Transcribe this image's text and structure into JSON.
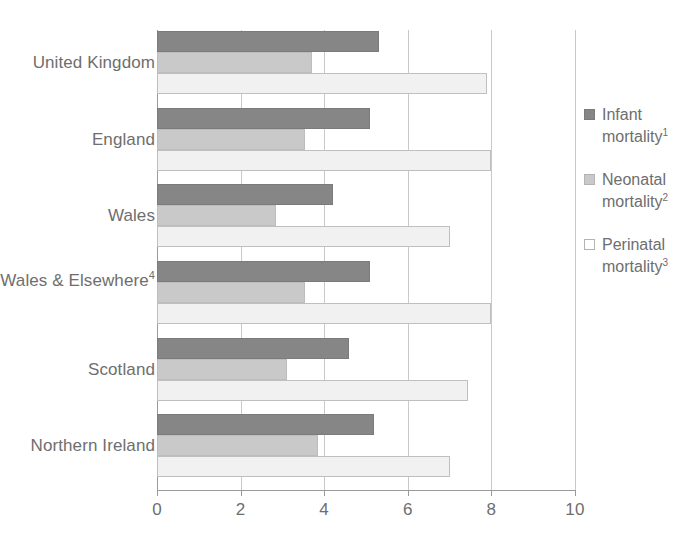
{
  "chart_data": {
    "type": "bar",
    "orientation": "horizontal",
    "title": "",
    "xlabel": "",
    "ylabel": "",
    "xlim": [
      0,
      10
    ],
    "xticks": [
      0,
      2,
      4,
      6,
      8,
      10
    ],
    "xtick_labels": [
      "0",
      "2",
      "4",
      "6",
      "8",
      "10"
    ],
    "grid": true,
    "legend_position": "right",
    "categories": [
      "United Kingdom",
      "England",
      "Wales",
      "England, Wales & Elsewhere",
      "Scotland",
      "Northern Ireland"
    ],
    "category_footnotes": [
      "",
      "",
      "",
      "4",
      "",
      ""
    ],
    "series": [
      {
        "name": "Infant mortality",
        "footnote": "1",
        "color": "#868686",
        "values": [
          5.3,
          5.1,
          4.2,
          5.1,
          4.6,
          5.2
        ]
      },
      {
        "name": "Neonatal mortality",
        "footnote": "2",
        "color": "#c9c9c9",
        "values": [
          3.7,
          3.55,
          2.85,
          3.55,
          3.1,
          3.85
        ]
      },
      {
        "name": "Perinatal mortality",
        "footnote": "3",
        "color": "#f1f1f1",
        "values": [
          7.9,
          8.0,
          7.0,
          8.0,
          7.45,
          7.0
        ]
      }
    ]
  },
  "legend": {
    "items": [
      {
        "label": "Infant mortality",
        "footnote": "1",
        "swatch": "infant"
      },
      {
        "label": "Neonatal mortality",
        "footnote": "2",
        "swatch": "neonatal"
      },
      {
        "label": "Perinatal mortality",
        "footnote": "3",
        "swatch": "perinatal"
      }
    ]
  }
}
